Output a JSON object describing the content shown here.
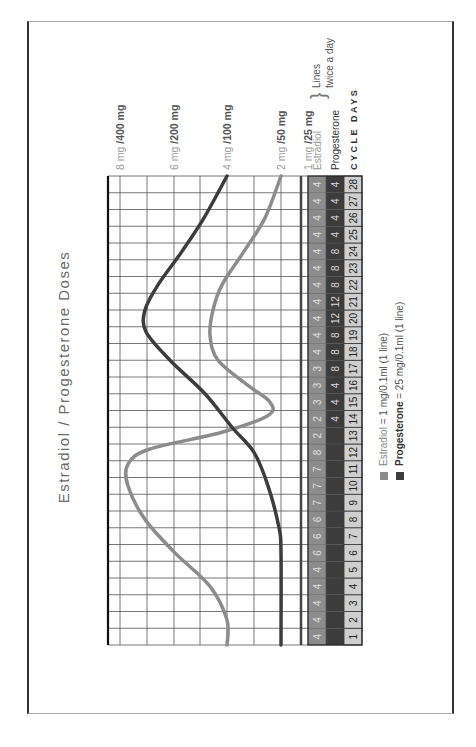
{
  "title": "Estradiol / Progesterone Doses",
  "axis_labels": [
    {
      "low": "8 mg",
      "high": "400 mg",
      "value": 8
    },
    {
      "low": "6 mg",
      "high": "200 mg",
      "value": 6
    },
    {
      "low": "4 mg",
      "high": "100 mg",
      "value": 4
    },
    {
      "low": "2 mg",
      "high": "50 mg",
      "value": 2
    },
    {
      "low": "1 mg",
      "high": "25 mg",
      "value": 1
    }
  ],
  "table": {
    "row_labels": {
      "estradiol": "Estradiol",
      "progesterone": "Progesterone",
      "days": "CYCLE DAYS"
    },
    "brace_note": [
      "Lines",
      "twice a day"
    ],
    "days": [
      1,
      2,
      3,
      4,
      5,
      6,
      7,
      8,
      9,
      10,
      11,
      12,
      13,
      14,
      15,
      16,
      17,
      18,
      19,
      20,
      21,
      22,
      23,
      24,
      25,
      26,
      27,
      28
    ],
    "estradiol": [
      "4",
      "4",
      "4",
      "4",
      "4",
      "6",
      "6",
      "6",
      "7",
      "7",
      "7",
      "8",
      "2",
      "2",
      "3",
      "3",
      "3",
      "4",
      "4",
      "4",
      "4",
      "4",
      "4",
      "4",
      "4",
      "4",
      "4",
      "4"
    ],
    "progesterone": [
      "",
      "",
      "",
      "",
      "",
      "",
      "",
      "",
      "",
      "",
      "",
      "",
      "",
      "4",
      "4",
      "4",
      "8",
      "8",
      "8",
      "12",
      "12",
      "8",
      "8",
      "8",
      "4",
      "4",
      "4",
      "4"
    ]
  },
  "legend": [
    {
      "name": "Estradiol",
      "text": " = 1 mg/0.1ml (1 line)",
      "color": "#8c8c8c"
    },
    {
      "name": "Progesterone",
      "text": " = 25 mg/0.1ml (1 line)",
      "color": "#3c3c3c"
    }
  ],
  "colors": {
    "estradiol": "#8c8c8c",
    "progesterone": "#3c3c3c",
    "day_cell": "#cfcfcf",
    "grid": "#222222"
  },
  "chart_data": {
    "type": "line",
    "title": "Estradiol / Progesterone Doses",
    "xlabel": "CYCLE DAYS",
    "ylabel": "Dose (Estradiol mg / Progesterone mg)",
    "x": [
      1,
      2,
      3,
      4,
      5,
      6,
      7,
      8,
      9,
      10,
      11,
      12,
      13,
      14,
      15,
      16,
      17,
      18,
      19,
      20,
      21,
      22,
      23,
      24,
      25,
      26,
      27,
      28
    ],
    "y_ticks": [
      "1 mg / 25 mg",
      "2 mg / 50 mg",
      "4 mg / 100 mg",
      "6 mg / 200 mg",
      "8 mg / 400 mg"
    ],
    "series": [
      {
        "name": "Estradiol (mg)",
        "values": [
          4,
          4,
          4,
          4.3,
          5,
          5.8,
          6.5,
          7.2,
          7.7,
          7.9,
          7.8,
          7,
          5,
          2.6,
          2.2,
          2.4,
          3.2,
          4.2,
          4.8,
          5.2,
          5.2,
          5,
          4.6,
          4.1,
          3.5,
          2.9,
          2.4,
          2
        ],
        "lines_per_dose": [
          4,
          4,
          4,
          4,
          4,
          6,
          6,
          6,
          7,
          7,
          7,
          8,
          2,
          2,
          3,
          3,
          3,
          4,
          4,
          4,
          4,
          4,
          4,
          4,
          4,
          4,
          4,
          4
        ]
      },
      {
        "name": "Progesterone (mg)",
        "values": [
          50,
          50,
          50,
          50,
          50,
          50,
          50,
          52,
          56,
          62,
          70,
          80,
          92,
          105,
          125,
          150,
          175,
          200,
          225,
          245,
          250,
          240,
          215,
          185,
          160,
          140,
          120,
          100
        ],
        "lines_per_dose": [
          0,
          0,
          0,
          0,
          0,
          0,
          0,
          0,
          0,
          0,
          0,
          0,
          0,
          4,
          4,
          4,
          8,
          8,
          8,
          12,
          12,
          8,
          8,
          8,
          4,
          4,
          4,
          4
        ]
      }
    ],
    "grid": true,
    "legend_position": "bottom"
  }
}
